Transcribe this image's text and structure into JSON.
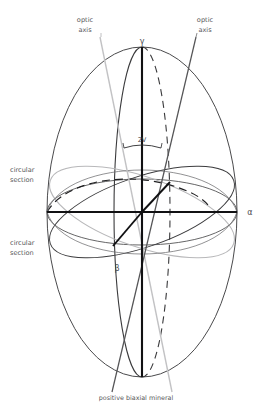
{
  "diagram": {
    "caption": "positive biaxial mineral",
    "labels": {
      "optic_axis_left_line1": "optic",
      "optic_axis_left_line2": "axis",
      "optic_axis_right_line1": "optic",
      "optic_axis_right_line2": "axis",
      "circular_section_top_line1": "circular",
      "circular_section_top_line2": "section",
      "circular_section_bottom_line1": "circular",
      "circular_section_bottom_line2": "section",
      "axis_gamma": "γ",
      "axis_alpha": "α",
      "axis_beta": "β",
      "angle_2v": "2V"
    },
    "colors": {
      "outline": "#4a4a4c",
      "dark_line": "#1a1a1a",
      "mid_gray": "#6e6e70",
      "light_gray": "#b8b8ba",
      "text": "#58585a",
      "background": "#ffffff"
    },
    "geometry": {
      "center_x": 142,
      "center_y": 212,
      "semi_axis_horizontal": 95,
      "semi_axis_vertical": 165,
      "top_vertex_y": 47,
      "bottom_vertex_y": 377,
      "left_vertex_x": 47,
      "right_vertex_x": 237
    },
    "elements": [
      "outer-ellipse-outline",
      "vertical-principal-axis-gamma",
      "horizontal-principal-axis-alpha",
      "beta-axis-dashed-ellipse",
      "equatorial-ellipse",
      "circular-section-ellipse-dark",
      "circular-section-ellipse-light",
      "optic-axis-line-left",
      "optic-axis-line-right",
      "optic-axis-trace-dark-upper-right",
      "optic-axis-trace-dark-lower-left",
      "angle-arc-2v"
    ]
  }
}
